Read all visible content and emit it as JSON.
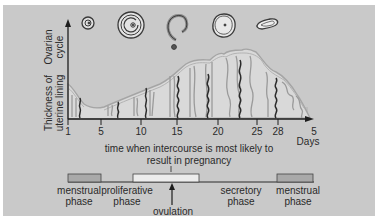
{
  "diagram": {
    "y_axis_labels": {
      "ovarian_line1": "Ovarian",
      "ovarian_line2": "cycle",
      "lining_line1": "Thickness of",
      "lining_line2": "uterine lining"
    },
    "x_axis": {
      "ticks": [
        {
          "label": "1",
          "x": 68
        },
        {
          "label": "5",
          "x": 101
        },
        {
          "label": "10",
          "x": 141
        },
        {
          "label": "15",
          "x": 177
        },
        {
          "label": "20",
          "x": 218
        },
        {
          "label": "25",
          "x": 257
        },
        {
          "label": "28",
          "x": 278
        },
        {
          "label": "5",
          "x": 314
        }
      ],
      "unit_label": "Days"
    },
    "annotation": {
      "line1": "time when intercourse is most likely to",
      "line2": "result in pregnancy"
    },
    "phases": [
      {
        "line1": "menstrual",
        "line2": "phase"
      },
      {
        "line1": "proliferative",
        "line2": "phase"
      },
      {
        "line1": "secretory",
        "line2": "phase"
      },
      {
        "line1": "menstrual",
        "line2": "phase"
      }
    ],
    "ovulation_label": "ovulation",
    "ovarian_stages": [
      "primary-follicle-icon",
      "mature-follicle-icon",
      "ruptured-follicle-icon",
      "corpus-luteum-icon",
      "corpus-albicans-icon"
    ],
    "colors": {
      "background": "#c9c9c9",
      "lining_fill": "#d6d6d6",
      "lining_outline": "#a8a8a8",
      "artery": "#2b2b2b",
      "gland": "#9a9a9a",
      "menstrual_bar": "#a9a9a9",
      "fertile_bar": "#ececec",
      "axis": "#1e1e1e"
    }
  }
}
